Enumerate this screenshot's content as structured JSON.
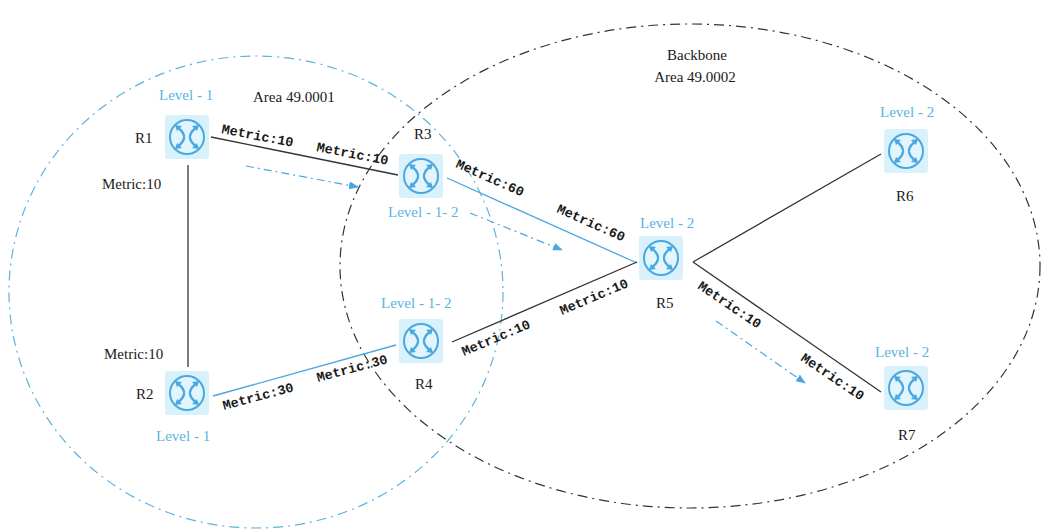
{
  "colors": {
    "accent_blue": "#4aa8e0",
    "router_bg": "#d8f1fb",
    "black": "#1a1a1a"
  },
  "areas": [
    {
      "id": "area1",
      "title": "Area 49.0001",
      "subtitle": ""
    },
    {
      "id": "backbone",
      "title": "Backbone",
      "subtitle": "Area 49.0002"
    }
  ],
  "routers": [
    {
      "name": "R1",
      "level": "Level - 1",
      "x": 187,
      "y": 137
    },
    {
      "name": "R2",
      "level": "Level - 1",
      "x": 187,
      "y": 393
    },
    {
      "name": "R3",
      "level": "Level - 1- 2",
      "x": 421,
      "y": 176
    },
    {
      "name": "R4",
      "level": "Level - 1- 2",
      "x": 421,
      "y": 341
    },
    {
      "name": "R5",
      "level": "Level - 2",
      "x": 661,
      "y": 258
    },
    {
      "name": "R6",
      "level": "Level - 2",
      "x": 906,
      "y": 151
    },
    {
      "name": "R7",
      "level": "Level - 2",
      "x": 906,
      "y": 388
    }
  ],
  "links": [
    {
      "from": "R1",
      "to": "R3",
      "metric_a": "Metric:10",
      "metric_b": "Metric:10",
      "color": "black"
    },
    {
      "from": "R1",
      "to": "R2",
      "metric_a": "Metric:10",
      "metric_b": "Metric:10",
      "color": "black"
    },
    {
      "from": "R2",
      "to": "R4",
      "metric_a": "Metric:30",
      "metric_b": "Metric:30",
      "color": "blue"
    },
    {
      "from": "R3",
      "to": "R5",
      "metric_a": "Metric:60",
      "metric_b": "Metric:60",
      "color": "blue"
    },
    {
      "from": "R4",
      "to": "R5",
      "metric_a": "Metric:10",
      "metric_b": "Metric:10",
      "color": "black"
    },
    {
      "from": "R5",
      "to": "R6",
      "metric_a": "",
      "metric_b": "",
      "color": "black"
    },
    {
      "from": "R5",
      "to": "R7",
      "metric_a": "Metric:10",
      "metric_b": "Metric:10",
      "color": "black"
    }
  ],
  "traffic_arrows": [
    {
      "segment": "R1-R3"
    },
    {
      "segment": "R3-R5"
    },
    {
      "segment": "R5-R7"
    }
  ]
}
